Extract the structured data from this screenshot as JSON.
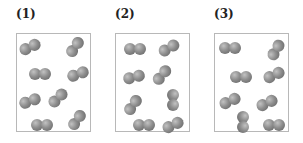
{
  "panels": [
    {
      "label": "(1)",
      "left": 16,
      "molecules": [
        {
          "x": 13,
          "y": 13,
          "angle": -25
        },
        {
          "x": 58,
          "y": 13,
          "angle": -55
        },
        {
          "x": 23,
          "y": 40,
          "angle": 0
        },
        {
          "x": 61,
          "y": 40,
          "angle": -20
        },
        {
          "x": 13,
          "y": 67,
          "angle": -20
        },
        {
          "x": 41,
          "y": 64,
          "angle": -45
        },
        {
          "x": 25,
          "y": 91,
          "angle": 0
        },
        {
          "x": 60,
          "y": 86,
          "angle": -55
        }
      ]
    },
    {
      "label": "(2)",
      "left": 115,
      "molecules": [
        {
          "x": 19,
          "y": 15,
          "angle": 0
        },
        {
          "x": 53,
          "y": 14,
          "angle": -30
        },
        {
          "x": 18,
          "y": 43,
          "angle": -15
        },
        {
          "x": 46,
          "y": 41,
          "angle": -50
        },
        {
          "x": 17,
          "y": 71,
          "angle": -55
        },
        {
          "x": 57,
          "y": 66,
          "angle": 90
        },
        {
          "x": 28,
          "y": 91,
          "angle": 0
        },
        {
          "x": 57,
          "y": 91,
          "angle": -25
        }
      ]
    },
    {
      "label": "(3)",
      "left": 214,
      "molecules": [
        {
          "x": 15,
          "y": 14,
          "angle": 0
        },
        {
          "x": 61,
          "y": 16,
          "angle": -60
        },
        {
          "x": 26,
          "y": 43,
          "angle": 0
        },
        {
          "x": 59,
          "y": 41,
          "angle": -25
        },
        {
          "x": 15,
          "y": 67,
          "angle": -25
        },
        {
          "x": 52,
          "y": 69,
          "angle": -25
        },
        {
          "x": 28,
          "y": 88,
          "angle": 90
        },
        {
          "x": 59,
          "y": 91,
          "angle": 0
        }
      ]
    }
  ],
  "colors": {
    "atom_light": "#c2c2c2",
    "atom_dark": "#5e5e5e",
    "box_border": "#b8b8b8"
  }
}
